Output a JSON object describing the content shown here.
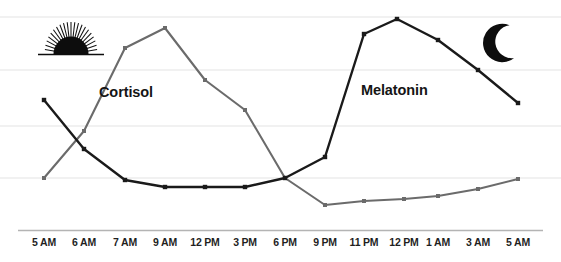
{
  "chart_data": {
    "type": "line",
    "title": "",
    "subtitle": "",
    "xlabel": "",
    "ylabel": "",
    "grid": true,
    "gridlines_y": [
      17,
      70,
      126,
      178
    ],
    "axis_line_y": 230,
    "legend_position": "inline-annotation",
    "ylim": [
      0,
      100
    ],
    "xlim_labels": [
      "5 AM",
      "5 AM"
    ],
    "categories": [
      "5 AM",
      "6 AM",
      "7 AM",
      "9 AM",
      "12 PM",
      "3 PM",
      "6 PM",
      "9 PM",
      "11 PM",
      "12 PM",
      "1 AM",
      "3 AM",
      "5 AM"
    ],
    "series": [
      {
        "name": "Cortisol",
        "color": "#6b6b6b",
        "marker": "square",
        "values": [
          24,
          60,
          85,
          96,
          70,
          48,
          24,
          11,
          13,
          14,
          16,
          19,
          24
        ],
        "pixel_points": [
          [
            44,
            178
          ],
          [
            84,
            131
          ],
          [
            125,
            48
          ],
          [
            165,
            28
          ],
          [
            205,
            80
          ],
          [
            245,
            110
          ],
          [
            285,
            178
          ],
          [
            325,
            205
          ],
          [
            364,
            201
          ],
          [
            404,
            199
          ],
          [
            438,
            196
          ],
          [
            478,
            189
          ],
          [
            518,
            179
          ]
        ]
      },
      {
        "name": "Melatonin",
        "color": "#1a1a1a",
        "marker": "square",
        "values": [
          61,
          38,
          22,
          19,
          19,
          19,
          24,
          30,
          86,
          98,
          88,
          73,
          58
        ],
        "pixel_points": [
          [
            44,
            100
          ],
          [
            84,
            149
          ],
          [
            125,
            180
          ],
          [
            165,
            187
          ],
          [
            205,
            187
          ],
          [
            245,
            187
          ],
          [
            285,
            178
          ],
          [
            325,
            157
          ],
          [
            364,
            34
          ],
          [
            397,
            19
          ],
          [
            438,
            40
          ],
          [
            478,
            70
          ],
          [
            518,
            103
          ]
        ]
      }
    ],
    "annotations": [
      {
        "name": "Cortisol",
        "x": 137,
        "y": 93
      },
      {
        "name": "Melatonin",
        "x": 408,
        "y": 91
      }
    ],
    "icons": [
      {
        "name": "sunrise-icon",
        "x": 70,
        "y": 45,
        "meaning": "daytime / morning"
      },
      {
        "name": "crescent-moon-icon",
        "x": 498,
        "y": 45,
        "meaning": "nighttime"
      }
    ]
  },
  "axis": {
    "tick_labels": [
      {
        "text": "5 AM",
        "x": 44
      },
      {
        "text": "6 AM",
        "x": 84
      },
      {
        "text": "7 AM",
        "x": 125
      },
      {
        "text": "9 AM",
        "x": 165
      },
      {
        "text": "12 PM",
        "x": 205
      },
      {
        "text": "3 PM",
        "x": 245
      },
      {
        "text": "6 PM",
        "x": 285
      },
      {
        "text": "9 PM",
        "x": 325
      },
      {
        "text": "11 PM",
        "x": 364
      },
      {
        "text": "12 PM",
        "x": 404
      },
      {
        "text": "1 AM",
        "x": 438
      },
      {
        "text": "3 AM",
        "x": 478
      },
      {
        "text": "5 AM",
        "x": 518
      }
    ]
  },
  "labels": {
    "cortisol": "Cortisol",
    "melatonin": "Melatonin"
  },
  "colors": {
    "cortisol_line": "#6b6b6b",
    "melatonin_line": "#1a1a1a",
    "gridline": "#ededed",
    "axis_line": "#b4b4b4",
    "background": "#ffffff",
    "text": "#1f1f1f"
  }
}
